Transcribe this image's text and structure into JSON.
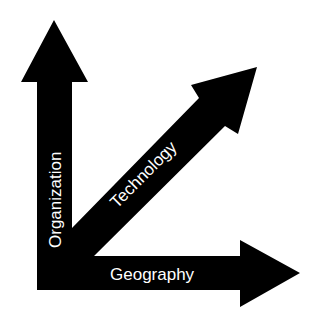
{
  "diagram": {
    "type": "axes-arrows",
    "background_color": "#ffffff",
    "arrow_color": "#000000",
    "label_color": "#ffffff",
    "axes": [
      {
        "id": "vertical",
        "direction": "up",
        "label": "Organization"
      },
      {
        "id": "diagonal",
        "direction": "up-right",
        "label": "Technology"
      },
      {
        "id": "horizontal",
        "direction": "right",
        "label": "Geography"
      }
    ]
  }
}
